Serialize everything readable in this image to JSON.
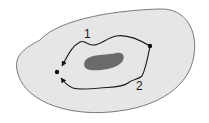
{
  "diagram": {
    "colors": {
      "background": "#ffffff",
      "region_fill": "#e6e6e6",
      "region_stroke": "#7a7a7a",
      "hole_fill": "#6b6b6b",
      "path_stroke": "#1a1a1a",
      "point_fill": "#111111"
    },
    "region": {
      "name": "domain"
    },
    "hole": {
      "name": "obstacle"
    },
    "points": [
      {
        "name": "start-point",
        "x": 150,
        "y": 46
      },
      {
        "name": "end-point",
        "x": 57,
        "y": 72
      }
    ],
    "paths": [
      {
        "id": "path-1",
        "label": "1",
        "label_x": 84,
        "label_y": 28
      },
      {
        "id": "path-2",
        "label": "2",
        "label_x": 136,
        "label_y": 80
      }
    ]
  }
}
